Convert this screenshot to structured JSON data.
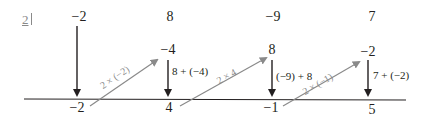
{
  "question_number": "2",
  "top_row": [
    "-2",
    "8",
    "-9",
    "7"
  ],
  "middle_row": [
    "-4",
    "8",
    "-2"
  ],
  "bottom_row": [
    "-2",
    "4",
    "-1",
    "5"
  ],
  "down_labels": [
    "8 + (-4)",
    "(-9) + 8",
    "7 + (-2)"
  ],
  "diagonal_labels": [
    "2 × (-2)",
    "2 × 4",
    "2 × (-1)"
  ],
  "colors": {
    "ink": "#231f20",
    "diagonal": "#8a8a8a"
  }
}
